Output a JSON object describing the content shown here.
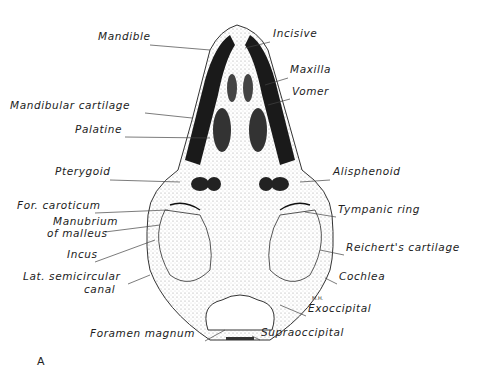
{
  "figure": {
    "panel_label": "A",
    "initials": "M.H.",
    "labels_left": [
      {
        "text": "Mandible",
        "x": 98,
        "y": 40
      },
      {
        "text": "Mandibular cartilage",
        "x": 10,
        "y": 109
      },
      {
        "text": "Palatine",
        "x": 75,
        "y": 133
      },
      {
        "text": "Pterygoid",
        "x": 55,
        "y": 175
      },
      {
        "text": "For. caroticum",
        "x": 17,
        "y": 209
      },
      {
        "text": "Manubrium",
        "x": 53,
        "y": 225
      },
      {
        "text": "of malleus",
        "x": 47,
        "y": 237
      },
      {
        "text": "Incus",
        "x": 67,
        "y": 258
      },
      {
        "text": "Lat. semicircular",
        "x": 23,
        "y": 280
      },
      {
        "text": "canal",
        "x": 84,
        "y": 293
      },
      {
        "text": "Foramen magnum",
        "x": 90,
        "y": 337
      }
    ],
    "labels_right": [
      {
        "text": "Incisive",
        "x": 273,
        "y": 37
      },
      {
        "text": "Maxilla",
        "x": 290,
        "y": 73
      },
      {
        "text": "Vomer",
        "x": 292,
        "y": 95
      },
      {
        "text": "Alisphenoid",
        "x": 333,
        "y": 175
      },
      {
        "text": "Tympanic ring",
        "x": 338,
        "y": 213
      },
      {
        "text": "Reichert's cartilage",
        "x": 346,
        "y": 251
      },
      {
        "text": "Cochlea",
        "x": 339,
        "y": 280
      },
      {
        "text": "Exoccipital",
        "x": 308,
        "y": 312
      },
      {
        "text": "Supraoccipital",
        "x": 261,
        "y": 336
      }
    ]
  }
}
